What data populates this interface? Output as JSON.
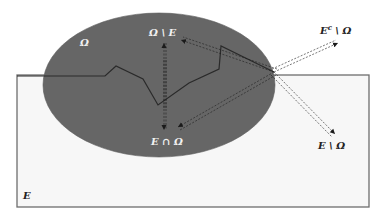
{
  "diagram": {
    "type": "set-diagram",
    "colors": {
      "background": "#ffffff",
      "set_E_fill": "#f7f7f7",
      "set_E_stroke": "#6e6e6e",
      "set_Omega_fill": "#666666",
      "boundary_line": "#2a2a2a",
      "arrow_line": "#2a2a2a",
      "label_on_dark": "#f2f2f2",
      "label_on_light": "#222222"
    },
    "labels": {
      "omega": "Ω",
      "omega_minus_e": "Ω \\ E",
      "e_cap_omega": "E ∩ Ω",
      "ec_minus_omega_base": "E",
      "ec_minus_omega_sup": "c",
      "ec_minus_omega_rest": " \\ Ω",
      "e_minus_omega": "E \\ Ω",
      "e": "E"
    },
    "shapes": {
      "set_E_rect": {
        "x": 17,
        "y": 75,
        "width": 352,
        "height": 132
      },
      "set_Omega_ellipse": {
        "cx": 159,
        "cy": 85,
        "rx": 116,
        "ry": 72
      },
      "jagged_boundary_points": "17,76 105,76 116,66 143,79 158,105 189,83 219,69 221,46 274,72"
    }
  }
}
